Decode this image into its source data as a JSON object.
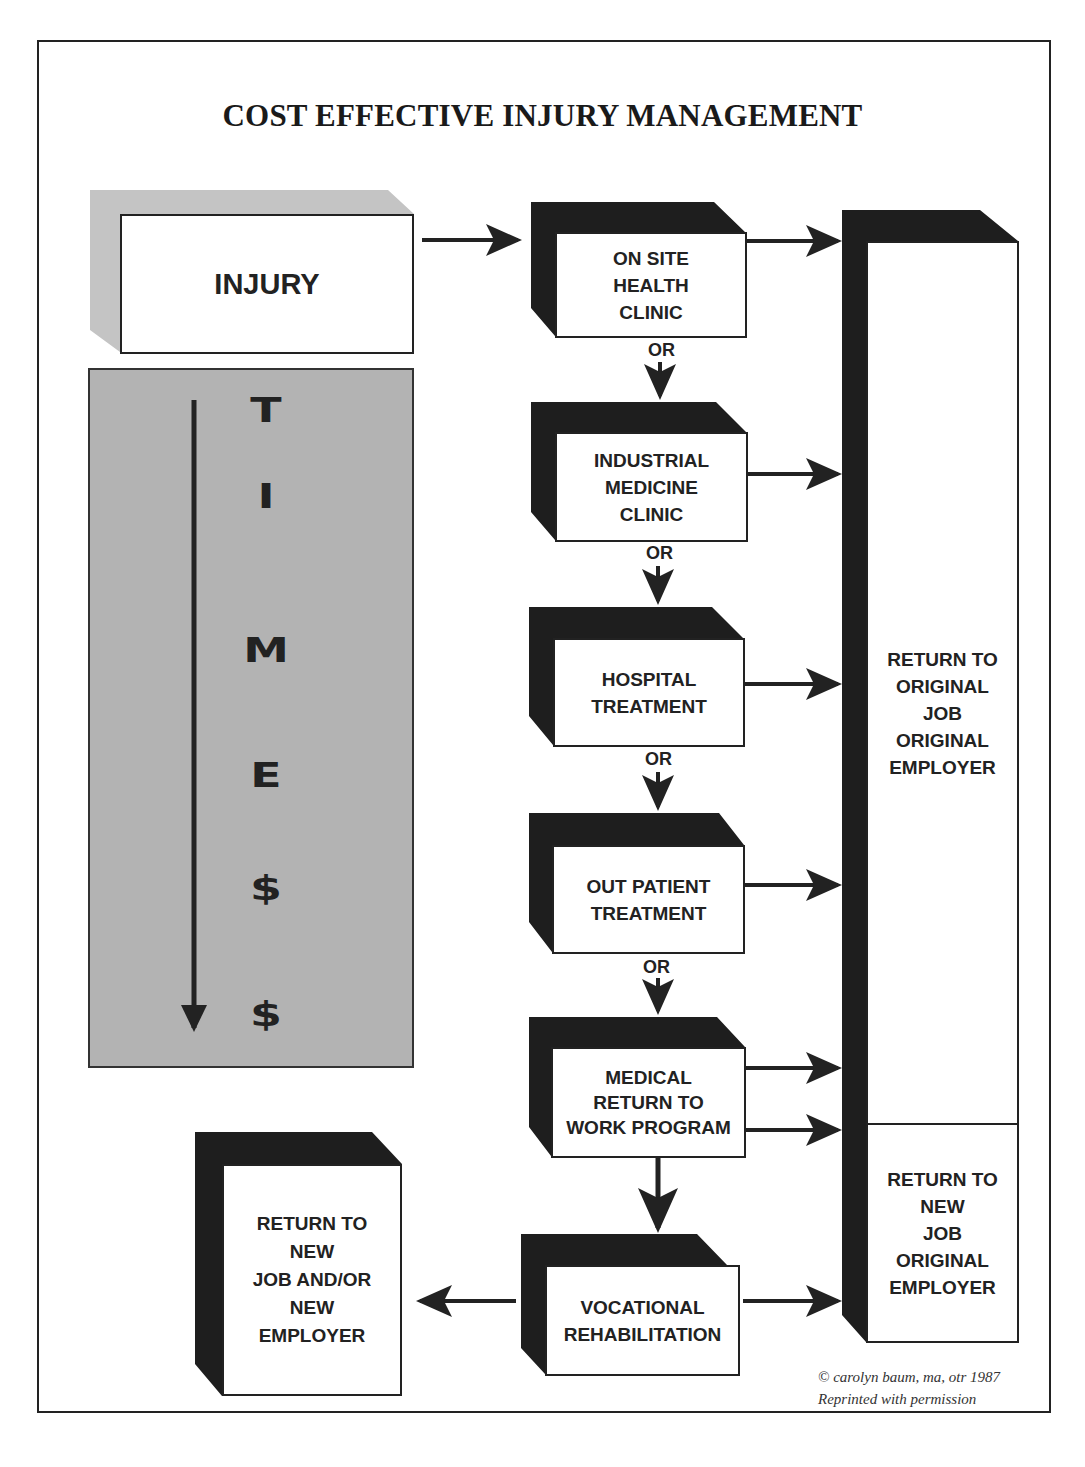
{
  "title": "COST EFFECTIVE INJURY MANAGEMENT",
  "start_node": {
    "label": "INJURY"
  },
  "time_column": {
    "letters": [
      "T",
      "I",
      "M",
      "E",
      "$",
      "$"
    ],
    "arrow": "down-arrow",
    "fill_color": "#b3b3b3"
  },
  "steps": [
    {
      "id": "on-site-health-clinic",
      "lines": [
        "ON SITE",
        "HEALTH",
        "CLINIC"
      ]
    },
    {
      "id": "industrial-medicine-clinic",
      "lines": [
        "INDUSTRIAL",
        "MEDICINE",
        "CLINIC"
      ]
    },
    {
      "id": "hospital-treatment",
      "lines": [
        "HOSPITAL",
        "TREATMENT"
      ]
    },
    {
      "id": "out-patient-treatment",
      "lines": [
        "OUT PATIENT",
        "TREATMENT"
      ]
    },
    {
      "id": "medical-return-to-work-program",
      "lines": [
        "MEDICAL",
        "RETURN TO",
        "WORK PROGRAM"
      ]
    },
    {
      "id": "vocational-rehabilitation",
      "lines": [
        "VOCATIONAL",
        "REHABILITATION"
      ]
    }
  ],
  "connector_label": "OR",
  "outcomes": {
    "original_job": {
      "lines": [
        "RETURN TO",
        "ORIGINAL",
        "JOB",
        "ORIGINAL",
        "EMPLOYER"
      ]
    },
    "new_job_original_employer": {
      "lines": [
        "RETURN TO",
        "NEW",
        "JOB",
        "ORIGINAL",
        "EMPLOYER"
      ]
    },
    "new_job_new_employer": {
      "lines": [
        "RETURN TO",
        "NEW",
        "JOB AND/OR",
        "NEW",
        "EMPLOYER"
      ]
    }
  },
  "credit": {
    "line1": "© carolyn baum, ma, otr 1987",
    "line2": "Reprinted with permission"
  },
  "colors": {
    "ink": "#222222",
    "shadow": "#1e1e1e",
    "gray_panel": "#b3b3b3",
    "injury_shadow": "#c4c4c4"
  }
}
